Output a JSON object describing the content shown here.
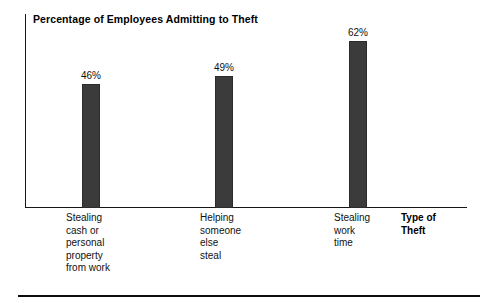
{
  "chart_data": {
    "type": "bar",
    "title": "Percentage of Employees Admitting to Theft",
    "xlabel": "Type of Theft",
    "ylabel": "",
    "categories": [
      "Stealing cash or personal property from work",
      "Helping someone else steal",
      "Stealing work time"
    ],
    "category_lines": [
      [
        "Stealing",
        "cash or",
        "personal",
        "property",
        "from work"
      ],
      [
        "Helping",
        "someone",
        "else",
        "steal"
      ],
      [
        "Stealing",
        "work",
        "time"
      ]
    ],
    "values": [
      46,
      49,
      62
    ],
    "value_labels": [
      "46%",
      "49%",
      "62%"
    ],
    "ylim": [
      0,
      72
    ],
    "grid": false,
    "legend": false,
    "bar_color": "#3b3b3b",
    "axis_color": "#161616",
    "text_color": "#111111"
  },
  "figure": {
    "title": "Percentage of Employees Admitting to Theft",
    "axis_title_lines": [
      "Type of",
      "Theft"
    ]
  }
}
